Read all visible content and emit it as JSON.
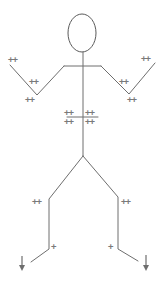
{
  "diagram": {
    "colors": {
      "line": "#6e6e6e",
      "marks": "#7a7a7a",
      "background": "#ffffff"
    },
    "markers": {
      "left_hand": "++",
      "left_forearm": "++",
      "left_elbow": "++",
      "right_hand": "++",
      "right_forearm": "++",
      "right_elbow": "++",
      "trunk_upper_left": "++",
      "trunk_upper_right": "++",
      "trunk_lower_left": "++",
      "trunk_lower_right": "++",
      "left_knee": "++",
      "right_knee": "++",
      "left_ankle": "+",
      "right_ankle": "+"
    },
    "arrows": {
      "left_foot": "down-arrow",
      "right_foot": "down-arrow"
    }
  }
}
